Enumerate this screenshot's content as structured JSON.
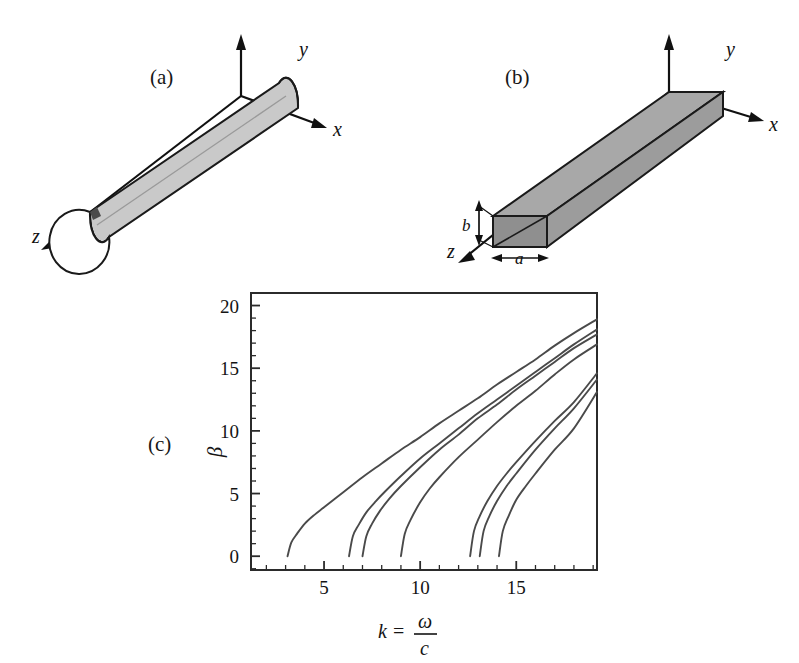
{
  "figure": {
    "panels": [
      {
        "id": "a",
        "label": "(a)",
        "caption_text": "(a)",
        "geometry": "circular-cylindrical-waveguide"
      },
      {
        "id": "b",
        "label": "(b)",
        "caption_text": "(b)",
        "geometry": "rectangular-waveguide"
      },
      {
        "id": "c",
        "label": "(c)",
        "caption_text": "(c)",
        "geometry": "dispersion-plot"
      }
    ]
  },
  "panel_a": {
    "label": "(a)",
    "axes": {
      "x": "x",
      "y": "y",
      "z": "z"
    },
    "fill_color": "#c9c9c9",
    "stroke_color": "#1a1a1a"
  },
  "panel_b": {
    "label": "(b)",
    "axes": {
      "x": "x",
      "y": "y",
      "z": "z"
    },
    "dimensions": {
      "width_label": "a",
      "height_label": "b"
    },
    "top_face_color": "#a8a8a8",
    "front_face_color": "#8f8f8f",
    "side_face_color": "#9c9c9c",
    "stroke_color": "#1a1a1a"
  },
  "chart_data": {
    "type": "line",
    "title": "",
    "subtitle": "",
    "xlabel": "k = ω/c",
    "xlabel_parts": {
      "variable": "k",
      "equals": "=",
      "numerator": "ω",
      "denominator": "c"
    },
    "ylabel": "β",
    "xlim": [
      1.2,
      19.2
    ],
    "ylim": [
      -1.1,
      21.0
    ],
    "x_ticks_major": [
      5,
      10,
      15
    ],
    "x_tick_labels": [
      "5",
      "10",
      "15"
    ],
    "x_minor_tick_step": 1,
    "y_ticks_major": [
      0,
      5,
      10,
      15,
      20
    ],
    "y_tick_labels": [
      "0",
      "5",
      "10",
      "15",
      "20"
    ],
    "y_minor_tick_step": 1,
    "grid": false,
    "legend": "none",
    "line_color": "#4a4a4a",
    "frame_color": "#2b2b2b",
    "series": [
      {
        "name": "mode-1",
        "cutoff": 3.1,
        "beta_at_xmax": 18.9,
        "values": [
          [
            3.1,
            0
          ],
          [
            3.3,
            1.1
          ],
          [
            3.6,
            1.8
          ],
          [
            4.0,
            2.6
          ],
          [
            4.5,
            3.3
          ],
          [
            5.0,
            3.9
          ],
          [
            6.0,
            5.1
          ],
          [
            7.0,
            6.3
          ],
          [
            8.0,
            7.4
          ],
          [
            9.0,
            8.5
          ],
          [
            10.0,
            9.5
          ],
          [
            11.0,
            10.6
          ],
          [
            12.0,
            11.6
          ],
          [
            13.0,
            12.6
          ],
          [
            14.0,
            13.7
          ],
          [
            15.0,
            14.7
          ],
          [
            16.0,
            15.7
          ],
          [
            17.0,
            16.8
          ],
          [
            18.0,
            17.8
          ],
          [
            19.2,
            18.9
          ]
        ]
      },
      {
        "name": "mode-2",
        "cutoff": 6.3,
        "beta_at_xmax": 18.1,
        "values": [
          [
            6.3,
            0
          ],
          [
            6.5,
            1.6
          ],
          [
            6.8,
            2.5
          ],
          [
            7.2,
            3.5
          ],
          [
            7.7,
            4.4
          ],
          [
            8.2,
            5.2
          ],
          [
            9.0,
            6.4
          ],
          [
            10.0,
            7.8
          ],
          [
            11.0,
            9.0
          ],
          [
            12.0,
            10.2
          ],
          [
            13.0,
            11.4
          ],
          [
            14.0,
            12.5
          ],
          [
            15.0,
            13.6
          ],
          [
            16.0,
            14.7
          ],
          [
            17.0,
            15.8
          ],
          [
            18.0,
            16.9
          ],
          [
            19.2,
            18.1
          ]
        ]
      },
      {
        "name": "mode-3",
        "cutoff": 7.0,
        "beta_at_xmax": 17.7,
        "values": [
          [
            7.0,
            0
          ],
          [
            7.2,
            1.6
          ],
          [
            7.5,
            2.6
          ],
          [
            7.9,
            3.6
          ],
          [
            8.4,
            4.6
          ],
          [
            9.0,
            5.6
          ],
          [
            10.0,
            7.1
          ],
          [
            11.0,
            8.5
          ],
          [
            12.0,
            9.7
          ],
          [
            13.0,
            11.0
          ],
          [
            14.0,
            12.1
          ],
          [
            15.0,
            13.3
          ],
          [
            16.0,
            14.4
          ],
          [
            17.0,
            15.5
          ],
          [
            18.0,
            16.6
          ],
          [
            19.2,
            17.7
          ]
        ]
      },
      {
        "name": "mode-4",
        "cutoff": 9.0,
        "beta_at_xmax": 16.9,
        "values": [
          [
            9.0,
            0
          ],
          [
            9.2,
            1.8
          ],
          [
            9.5,
            2.9
          ],
          [
            10.0,
            4.3
          ],
          [
            10.5,
            5.4
          ],
          [
            11.0,
            6.3
          ],
          [
            12.0,
            7.9
          ],
          [
            13.0,
            9.3
          ],
          [
            14.0,
            10.7
          ],
          [
            15.0,
            12.0
          ],
          [
            16.0,
            13.2
          ],
          [
            17.0,
            14.5
          ],
          [
            18.0,
            15.7
          ],
          [
            19.2,
            16.9
          ]
        ]
      },
      {
        "name": "mode-5",
        "cutoff": 12.6,
        "beta_at_xmax": 14.6,
        "values": [
          [
            12.6,
            0
          ],
          [
            12.8,
            2.0
          ],
          [
            13.1,
            3.2
          ],
          [
            13.5,
            4.4
          ],
          [
            14.0,
            5.6
          ],
          [
            14.5,
            6.6
          ],
          [
            15.0,
            7.5
          ],
          [
            16.0,
            9.2
          ],
          [
            17.0,
            10.8
          ],
          [
            18.0,
            12.3
          ],
          [
            19.2,
            14.6
          ]
        ]
      },
      {
        "name": "mode-6",
        "cutoff": 13.1,
        "beta_at_xmax": 14.1,
        "values": [
          [
            13.1,
            0
          ],
          [
            13.3,
            2.0
          ],
          [
            13.6,
            3.2
          ],
          [
            14.0,
            4.4
          ],
          [
            14.5,
            5.6
          ],
          [
            15.0,
            6.6
          ],
          [
            16.0,
            8.5
          ],
          [
            17.0,
            10.2
          ],
          [
            18.0,
            11.8
          ],
          [
            19.2,
            14.1
          ]
        ]
      },
      {
        "name": "mode-7",
        "cutoff": 14.1,
        "beta_at_xmax": 13.1,
        "values": [
          [
            14.1,
            0
          ],
          [
            14.3,
            2.0
          ],
          [
            14.6,
            3.2
          ],
          [
            15.0,
            4.5
          ],
          [
            15.5,
            5.6
          ],
          [
            16.0,
            6.6
          ],
          [
            17.0,
            8.5
          ],
          [
            18.0,
            10.2
          ],
          [
            19.2,
            13.1
          ]
        ]
      }
    ]
  }
}
